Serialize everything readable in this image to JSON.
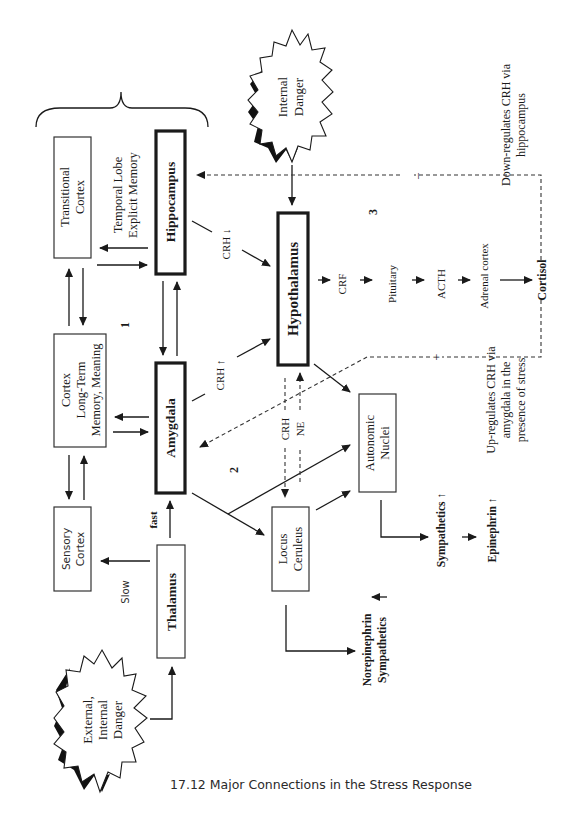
{
  "caption": "17.12  Major Connections in the Stress Response",
  "nodes": {
    "transitional_cortex": [
      "Transitional",
      "Cortex"
    ],
    "cortex": [
      "Cortex",
      "Long-Term",
      "Memory, Meaning"
    ],
    "sensory_cortex": [
      "Sensory",
      "Cortex"
    ],
    "hippocampus": "Hippocampus",
    "amygdala": "Amygdala",
    "thalamus": "Thalamus",
    "hypothalamus": "Hypothalamus",
    "locus_ceruleus": [
      "Locus",
      "Ceruleus"
    ],
    "autonomic_nuclei": [
      "Autonomic",
      "Nuclei"
    ],
    "internal_danger": [
      "Internal",
      "Danger"
    ],
    "external_danger": [
      "External,",
      "Internal",
      "Danger"
    ]
  },
  "labels": {
    "temporal_lobe": [
      "Temporal Lobe",
      "Explicit Memory"
    ],
    "crh_down": "CRH ↓",
    "crh_up": "CRH ↑",
    "crh": "CRH",
    "ne": "NE",
    "fast": "fast",
    "slow": "Slow",
    "pathway_1": "1",
    "pathway_2": "2",
    "pathway_3": "3",
    "crf": "CRF",
    "pituitary": "Pituitary",
    "acth": "ACTH",
    "adrenal_cortex": "Adrenal cortex",
    "cortisol": "Cortisol",
    "minus": "–",
    "plus": "+",
    "down_regulates": [
      "Down-regulates CRH via",
      "hippocampus"
    ],
    "up_regulates": [
      "Up-regulates CRH via",
      "amygdala in the",
      "presence of stress"
    ],
    "sympathetics_up": "Sympathetics ↑",
    "epinephrin_up": "Epinephrin ↑",
    "norepinephrin": "Norepinephrin",
    "sympathetics": "Sympathetics",
    "up_arrow": "↑"
  }
}
